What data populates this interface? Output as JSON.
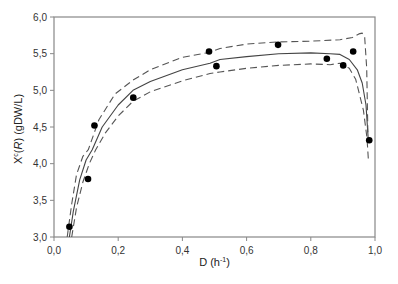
{
  "chart_data": {
    "type": "scatter",
    "title": "",
    "xlabel": "D (h⁻¹)",
    "xlabel_parts": {
      "base": "D (h",
      "sup": "-1",
      "tail": ")"
    },
    "ylabel": "X^c(R) (gDW/L)",
    "ylabel_parts": {
      "x": "X",
      "sup": "c",
      "rest1": "(",
      "r": "R",
      "rest2": ") (gDW/L)"
    },
    "xlim": [
      0.0,
      1.0
    ],
    "ylim": [
      3.0,
      6.0
    ],
    "xticks": [
      0.0,
      0.2,
      0.4,
      0.6,
      0.8,
      1.0
    ],
    "xtick_labels": [
      "0,0",
      "0,2",
      "0,4",
      "0,6",
      "0,8",
      "1,0"
    ],
    "yticks": [
      3.0,
      3.5,
      4.0,
      4.5,
      5.0,
      5.5,
      6.0
    ],
    "ytick_labels": [
      "3,0",
      "3,5",
      "4,0",
      "4,5",
      "5,0",
      "5,5",
      "6,0"
    ],
    "grid": false,
    "legend": null,
    "series": [
      {
        "name": "Experimental data",
        "type": "scatter",
        "color": "#000000",
        "x": [
          0.048,
          0.106,
          0.126,
          0.247,
          0.483,
          0.506,
          0.698,
          0.85,
          0.901,
          0.932,
          0.982
        ],
        "y": [
          3.14,
          3.79,
          4.52,
          4.9,
          5.53,
          5.33,
          5.62,
          5.43,
          5.34,
          5.53,
          4.32
        ]
      },
      {
        "name": "Model fit",
        "type": "line",
        "style": "solid",
        "color": "#444444",
        "x": [
          0.048,
          0.06,
          0.08,
          0.1,
          0.119,
          0.15,
          0.2,
          0.246,
          0.3,
          0.4,
          0.486,
          0.517,
          0.6,
          0.7,
          0.8,
          0.86,
          0.891,
          0.92,
          0.945,
          0.96,
          0.972,
          0.979
        ],
        "y": [
          3.0,
          3.35,
          3.78,
          4.05,
          4.19,
          4.5,
          4.8,
          5.0,
          5.12,
          5.28,
          5.37,
          5.42,
          5.46,
          5.5,
          5.51,
          5.5,
          5.49,
          5.42,
          5.28,
          5.1,
          4.8,
          4.32
        ]
      },
      {
        "name": "Upper confidence bound",
        "type": "line",
        "style": "dashed",
        "color": "#555555",
        "x": [
          0.041,
          0.055,
          0.07,
          0.09,
          0.107,
          0.14,
          0.19,
          0.246,
          0.3,
          0.4,
          0.486,
          0.517,
          0.6,
          0.7,
          0.8,
          0.891,
          0.93,
          0.95,
          0.96,
          0.968,
          0.974,
          0.978
        ],
        "y": [
          3.0,
          3.45,
          3.85,
          4.1,
          4.19,
          4.6,
          4.95,
          5.14,
          5.28,
          5.45,
          5.52,
          5.57,
          5.63,
          5.66,
          5.67,
          5.69,
          5.72,
          5.77,
          5.78,
          5.72,
          5.3,
          4.4
        ]
      },
      {
        "name": "Lower confidence bound",
        "type": "line",
        "style": "dashed",
        "color": "#555555",
        "x": [
          0.055,
          0.07,
          0.09,
          0.11,
          0.13,
          0.16,
          0.2,
          0.246,
          0.3,
          0.4,
          0.486,
          0.517,
          0.6,
          0.7,
          0.8,
          0.86,
          0.891,
          0.92,
          0.94,
          0.964,
          0.975,
          0.979
        ],
        "y": [
          3.0,
          3.4,
          3.75,
          4.0,
          4.19,
          4.42,
          4.65,
          4.85,
          4.98,
          5.13,
          5.23,
          5.25,
          5.3,
          5.34,
          5.36,
          5.35,
          5.37,
          5.3,
          5.15,
          4.73,
          4.35,
          4.07
        ]
      }
    ]
  },
  "plot_area": {
    "left": 54,
    "right": 375,
    "top": 17,
    "bottom": 237
  }
}
